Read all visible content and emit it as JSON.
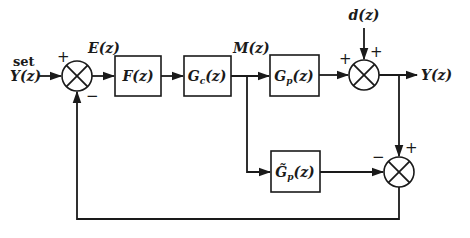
{
  "diagram": {
    "type": "block-diagram",
    "input": {
      "line1": "set",
      "line2": "Y(z)"
    },
    "signals": {
      "error": "E(z)",
      "manipulated": "M(z)",
      "disturbance": "d(z)",
      "output": "Y(z)"
    },
    "blocks": [
      {
        "id": "filter",
        "label": "F(z)"
      },
      {
        "id": "controller",
        "label_main": "G",
        "label_sub": "c",
        "label_arg": "(z)"
      },
      {
        "id": "process",
        "label_main": "G",
        "label_sub": "p",
        "label_arg": "(z)"
      },
      {
        "id": "model",
        "label_main": "G̃",
        "label_sub": "p",
        "label_arg": "(z)"
      }
    ],
    "junctions": [
      {
        "id": "sum-setpoint",
        "signs": {
          "left": "+",
          "bottom": "−"
        }
      },
      {
        "id": "sum-disturbance",
        "signs": {
          "left": "+",
          "top": "+"
        }
      },
      {
        "id": "sum-model-error",
        "signs": {
          "left": "−",
          "top": "+"
        }
      }
    ]
  }
}
